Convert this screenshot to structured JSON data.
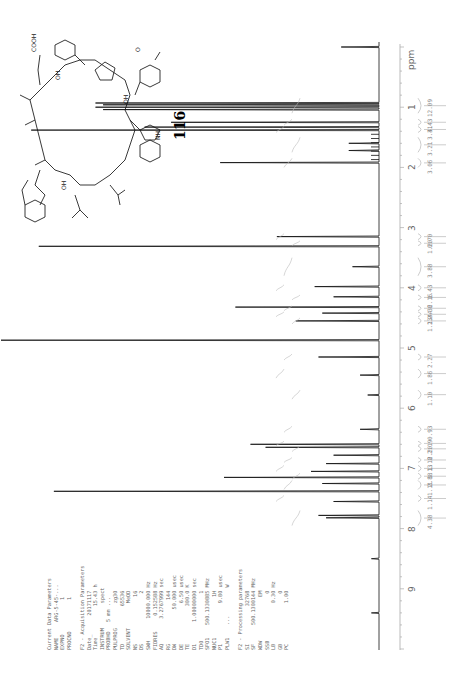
{
  "chart_data": {
    "type": "line",
    "xlabel": "ppm",
    "orientation": "rotated -90deg (ppm axis vertical, increasing downward)",
    "xlim": [
      0,
      10
    ],
    "ticks": [
      "1",
      "2",
      "3",
      "4",
      "5",
      "6",
      "7",
      "8",
      "9"
    ],
    "axis_unit": "ppm",
    "peaks": [
      {
        "ppm": 0.0,
        "height": 0.1
      },
      {
        "ppm": 0.93,
        "height": 0.75
      },
      {
        "ppm": 0.96,
        "height": 0.73
      },
      {
        "ppm": 1.0,
        "height": 0.75
      },
      {
        "ppm": 1.04,
        "height": 0.73
      },
      {
        "ppm": 1.25,
        "height": 0.55
      },
      {
        "ppm": 1.33,
        "height": 0.62
      },
      {
        "ppm": 1.38,
        "height": 0.92
      },
      {
        "ppm": 1.6,
        "height": 0.08
      },
      {
        "ppm": 1.72,
        "height": 0.08
      },
      {
        "ppm": 1.92,
        "height": 0.42
      },
      {
        "ppm": 3.15,
        "height": 0.27
      },
      {
        "ppm": 3.31,
        "height": 0.9
      },
      {
        "ppm": 3.65,
        "height": 0.07
      },
      {
        "ppm": 3.98,
        "height": 0.17
      },
      {
        "ppm": 4.15,
        "height": 0.12
      },
      {
        "ppm": 4.32,
        "height": 0.38
      },
      {
        "ppm": 4.42,
        "height": 0.15
      },
      {
        "ppm": 4.55,
        "height": 0.22
      },
      {
        "ppm": 4.87,
        "height": 1.0
      },
      {
        "ppm": 5.15,
        "height": 0.16
      },
      {
        "ppm": 5.45,
        "height": 0.05
      },
      {
        "ppm": 5.78,
        "height": 0.03
      },
      {
        "ppm": 6.35,
        "height": 0.05
      },
      {
        "ppm": 6.6,
        "height": 0.34
      },
      {
        "ppm": 6.65,
        "height": 0.3
      },
      {
        "ppm": 6.78,
        "height": 0.12
      },
      {
        "ppm": 6.92,
        "height": 0.14
      },
      {
        "ppm": 7.05,
        "height": 0.18
      },
      {
        "ppm": 7.15,
        "height": 0.41
      },
      {
        "ppm": 7.25,
        "height": 0.15
      },
      {
        "ppm": 7.38,
        "height": 0.86
      },
      {
        "ppm": 7.55,
        "height": 0.12
      },
      {
        "ppm": 7.78,
        "height": 0.16
      },
      {
        "ppm": 7.82,
        "height": 0.14
      },
      {
        "ppm": 8.5,
        "height": 0.02
      },
      {
        "ppm": 9.4,
        "height": 0.02
      }
    ],
    "integrals": [
      {
        "ppm_range": [
          0.85,
          1.1
        ],
        "value": "12.09"
      },
      {
        "ppm_range": [
          1.2,
          1.3
        ],
        "value": "3.43"
      },
      {
        "ppm_range": [
          1.32,
          1.42
        ],
        "value": "3.41"
      },
      {
        "ppm_range": [
          1.5,
          1.75
        ],
        "value": "3.21"
      },
      {
        "ppm_range": [
          1.85,
          2.0
        ],
        "value": "3.06"
      },
      {
        "ppm_range": [
          3.1,
          3.2
        ],
        "value": "0.70"
      },
      {
        "ppm_range": [
          3.22,
          3.3
        ],
        "value": "1.20"
      },
      {
        "ppm_range": [
          3.5,
          3.8
        ],
        "value": "3.88"
      },
      {
        "ppm_range": [
          3.95,
          4.05
        ],
        "value": "1.43"
      },
      {
        "ppm_range": [
          4.12,
          4.2
        ],
        "value": "2.16"
      },
      {
        "ppm_range": [
          4.3,
          4.38
        ],
        "value": "2.36"
      },
      {
        "ppm_range": [
          4.4,
          4.48
        ],
        "value": "2.44"
      },
      {
        "ppm_range": [
          4.5,
          4.6
        ],
        "value": "1.13"
      },
      {
        "ppm_range": [
          5.1,
          5.2
        ],
        "value": "2.27"
      },
      {
        "ppm_range": [
          5.35,
          5.5
        ],
        "value": "1.86"
      },
      {
        "ppm_range": [
          5.7,
          5.85
        ],
        "value": "1.10"
      },
      {
        "ppm_range": [
          6.3,
          6.4
        ],
        "value": "0.93"
      },
      {
        "ppm_range": [
          6.55,
          6.62
        ],
        "value": "2.19"
      },
      {
        "ppm_range": [
          6.63,
          6.72
        ],
        "value": "2.20"
      },
      {
        "ppm_range": [
          6.82,
          6.9
        ],
        "value": "1.18"
      },
      {
        "ppm_range": [
          6.95,
          7.05
        ],
        "value": "1.13"
      },
      {
        "ppm_range": [
          7.08,
          7.18
        ],
        "value": "2.88"
      },
      {
        "ppm_range": [
          7.2,
          7.35
        ],
        "value": "1.11"
      },
      {
        "ppm_range": [
          7.45,
          7.55
        ],
        "value": "1.14"
      },
      {
        "ppm_range": [
          7.7,
          7.95
        ],
        "value": "4.38"
      }
    ]
  },
  "axis": {
    "unit_label": "ppm",
    "tick_labels": [
      "1",
      "2",
      "3",
      "4",
      "5",
      "6",
      "7",
      "8",
      "9"
    ]
  },
  "compound": {
    "label": "116"
  },
  "parameters": {
    "text": "Current Data Parameters\nNAME     ARG-5-45-...\nEXPNO           1\nPROCNO          1\n\nF2 - Acquisition Parameters\nDate_      20171117\nTime          15.43 h\nINSTRUM        spect\nPROBHD   5 mm ...\nPULPROG        zg30\nTD            65536\nSOLVENT        MeOD\nNS               16\nDS                2\nSWH       10000.000 Hz\nFIDRES     0.152588 Hz\nAQ        3.2767999 sec\nRG              144\nDW           50.000 usec\nDE             6.50 usec\nTE            300.0 K\nD1       1.00000000 sec\nTD0               1\nSFO1    500.1330885 MHz\nNUC1             1H\nP1             9.80 usec\nPLW1    ...         W\n\nF2 - Processing parameters\nSI            32768\nSF      500.1300144 MHz\nWDW              EM\nSSB               0\nLB             0.30 Hz\nGB                0\nPC             1.00"
  }
}
